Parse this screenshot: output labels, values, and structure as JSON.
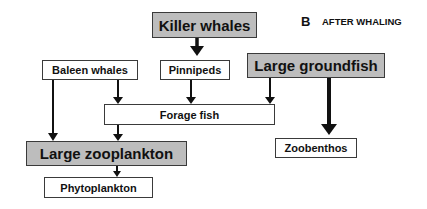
{
  "panel": {
    "letter": "B",
    "title": "AFTER WHALING"
  },
  "nodes": {
    "killer_whales": {
      "label": "Killer whales",
      "style": "gray"
    },
    "baleen_whales": {
      "label": "Baleen whales",
      "style": "white"
    },
    "pinnipeds": {
      "label": "Pinnipeds",
      "style": "white"
    },
    "large_groundfish": {
      "label": "Large groundfish",
      "style": "gray"
    },
    "forage_fish": {
      "label": "Forage fish",
      "style": "white"
    },
    "large_zooplankton": {
      "label": "Large zooplankton",
      "style": "gray"
    },
    "phytoplankton": {
      "label": "Phytoplankton",
      "style": "white"
    },
    "zoobenthos": {
      "label": "Zoobenthos",
      "style": "white"
    }
  },
  "edges": [
    {
      "from": "Killer whales",
      "to": "Pinnipeds",
      "weight": "thick"
    },
    {
      "from": "Baleen whales",
      "to": "Large zooplankton",
      "weight": "normal"
    },
    {
      "from": "Baleen whales",
      "to": "Forage fish",
      "weight": "normal"
    },
    {
      "from": "Pinnipeds",
      "to": "Forage fish",
      "weight": "normal"
    },
    {
      "from": "Large groundfish",
      "to": "Forage fish",
      "weight": "normal"
    },
    {
      "from": "Large groundfish",
      "to": "Zoobenthos",
      "weight": "thick"
    },
    {
      "from": "Forage fish",
      "to": "Large zooplankton",
      "weight": "normal"
    },
    {
      "from": "Large zooplankton",
      "to": "Phytoplankton",
      "weight": "normal"
    }
  ],
  "colors": {
    "highlight_fill": "#bdbdbd",
    "plain_fill": "#ffffff",
    "stroke": "#3a3a3a",
    "arrow": "#111111"
  }
}
